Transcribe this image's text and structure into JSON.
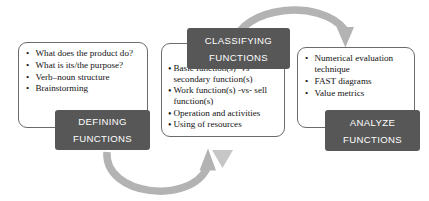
{
  "diagram": {
    "background_color": "#ffffff",
    "plate_color": "#575757",
    "plate_text_color": "#ffffff",
    "box_border_color": "#6b6b6b",
    "arrow_color": "#b3b3b3",
    "text_color": "#121212"
  },
  "stages": [
    {
      "id": "defining",
      "plate": {
        "line1": "DEFINING",
        "line2": "FUNCTIONS"
      },
      "bullets": [
        "What does the product do?",
        "What is its/the purpose?",
        "Verb–noun structure",
        "Brainstorming"
      ]
    },
    {
      "id": "classifying",
      "plate": {
        "line1": "CLASSIFYING",
        "line2": "FUNCTIONS"
      },
      "bullets": [
        "Basic function(s) -vs- secondary function(s)",
        "Work function(s) -vs- sell function(s)",
        "Operation and activities",
        "Using of resources"
      ]
    },
    {
      "id": "analyze",
      "plate": {
        "line1": "ANALYZE",
        "line2": "FUNCTIONS"
      },
      "bullets": [
        "Numerical evaluation technique",
        "FAST diagrams",
        "Value metrics"
      ]
    }
  ],
  "bullet_glyph": "•",
  "connectors": [
    {
      "id": "arc-classifying-to-analyze",
      "name": "top-arc-arrow",
      "from": "classifying",
      "to": "analyze",
      "direction": "down"
    },
    {
      "id": "arc-defining-to-classifying",
      "name": "bottom-arc-arrow",
      "from": "defining",
      "to": "classifying",
      "direction": "up"
    },
    {
      "id": "arrow-classifying-down",
      "name": "small-down-arrow",
      "from": "classifying",
      "to": "bottom-arc",
      "direction": "down"
    }
  ]
}
